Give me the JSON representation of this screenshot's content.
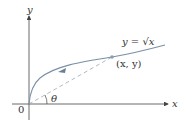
{
  "diagram": {
    "axis_x_label": "x",
    "axis_y_label": "y",
    "origin_label": "0",
    "curve_label": "y = √x",
    "point_label": "(x, y)",
    "angle_label": "θ",
    "colors": {
      "axis": "#444444",
      "curve": "#7a8fa6",
      "dashed": "#9aa8b8",
      "point": "#8a9fb5",
      "text": "#333333"
    }
  }
}
